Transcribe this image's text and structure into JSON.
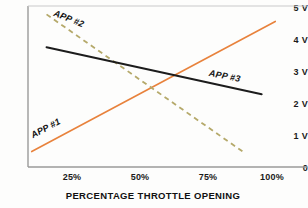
{
  "chart_data": {
    "type": "line",
    "title": "",
    "xlabel": "PERCENTAGE THROTTLE OPENING",
    "ylabel": "",
    "xlim": [
      0,
      110
    ],
    "ylim": [
      0,
      5
    ],
    "grid": false,
    "legend_position": "inline-on-curve",
    "x_ticks": [
      {
        "value": 25,
        "label": "25%"
      },
      {
        "value": 50,
        "label": "50%"
      },
      {
        "value": 75,
        "label": "75%"
      },
      {
        "value": 100,
        "label": "100%"
      }
    ],
    "y_ticks": [
      {
        "value": 5,
        "label": "5 V"
      },
      {
        "value": 4,
        "label": "4 V"
      },
      {
        "value": 3,
        "label": "3 V"
      },
      {
        "value": 2,
        "label": "2 V"
      },
      {
        "value": 1,
        "label": "1 V"
      },
      {
        "value": 0,
        "label": "0"
      }
    ],
    "series": [
      {
        "name": "APP #1",
        "label": "APP #1",
        "color": "#E8823C",
        "style": "solid",
        "x": [
          1.5,
          100
        ],
        "values": [
          0.48,
          4.52
        ],
        "annotation_x": 12,
        "annotation_y": 1.15
      },
      {
        "name": "APP #2",
        "label": "APP #2",
        "color": "#B5A96A",
        "style": "dashed",
        "x": [
          7.5,
          87
        ],
        "values": [
          4.74,
          0.47
        ],
        "annotation_x": 20,
        "annotation_y": 4.55
      },
      {
        "name": "APP #3",
        "label": "APP #3",
        "color": "#1C1C1C",
        "style": "solid",
        "x": [
          7.5,
          94.5
        ],
        "values": [
          3.72,
          2.26
        ],
        "annotation_x": 68,
        "annotation_y": 2.95
      }
    ]
  },
  "axes": {
    "axis_color": "#9a9a9a",
    "background": "#fdfdfc"
  }
}
